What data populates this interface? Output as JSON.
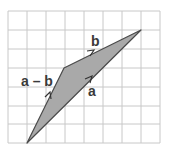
{
  "diagram": {
    "type": "vector-subtraction",
    "grid": {
      "columns": 8,
      "rows": 7,
      "left": 8,
      "top": 11,
      "cell": 19
    },
    "colors": {
      "grid": "#c8c8c8",
      "fill": "#a9a9a9",
      "edge": "#4a4a4a",
      "label": "#3a3a3a"
    },
    "points": {
      "origin": [
        27,
        143
      ],
      "vertex": [
        64,
        68
      ],
      "tip": [
        141,
        30
      ]
    },
    "vectors": [
      {
        "name": "a",
        "from": "origin",
        "to": "tip",
        "label": "a"
      },
      {
        "name": "b",
        "from": "vertex",
        "to": "tip",
        "label": "b"
      },
      {
        "name": "a-b",
        "from": "origin",
        "to": "vertex",
        "label": "a – b"
      }
    ],
    "labels": {
      "a": "a",
      "b": "b",
      "a_minus_b": "a – b"
    }
  }
}
